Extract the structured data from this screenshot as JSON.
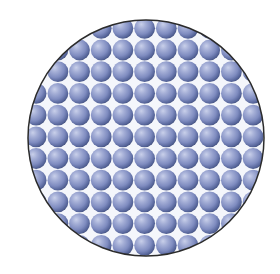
{
  "figure": {
    "width": 280,
    "height": 274,
    "circle": {
      "cx": 146,
      "cy": 138,
      "r": 118,
      "stroke": "#2b2b2b",
      "stroke_width": 1.5
    },
    "grid": {
      "arrangement": "square",
      "pitch": 21.7,
      "origin_x": 3.6,
      "origin_y": 6.6,
      "cols": 13,
      "rows": 13,
      "sphere_radius": 10.4
    },
    "colors": {
      "background": "#ffffff",
      "gap": "#f4f6fb",
      "sphere_highlight": "#c9d0ea",
      "sphere_light": "#a4aed6",
      "sphere_mid": "#7f8cc0",
      "sphere_dark": "#56659a",
      "sphere_edge": "#45527f"
    }
  }
}
